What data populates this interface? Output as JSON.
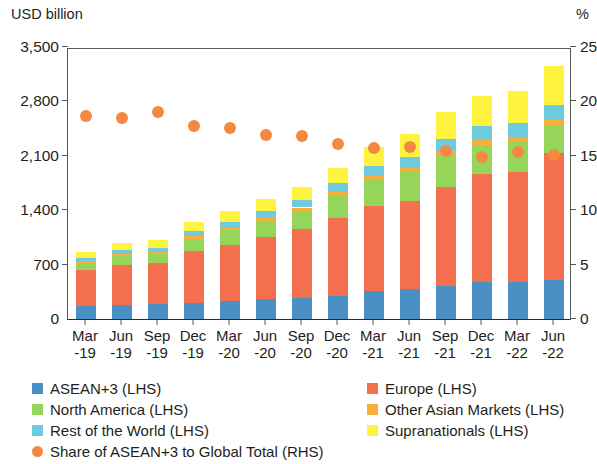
{
  "chart_data": {
    "type": "bar",
    "subtype": "stacked-bar-with-scatter-overlay",
    "title": "",
    "ylabel": "USD billion",
    "y2label": "%",
    "xlabel": "",
    "ylim": [
      0,
      3500
    ],
    "y2lim": [
      0,
      25
    ],
    "yticks": [
      "0",
      "700",
      "1,400",
      "2,100",
      "2,800",
      "3,500"
    ],
    "ytick_values": [
      0,
      700,
      1400,
      2100,
      2800,
      3500
    ],
    "y2ticks": [
      "0",
      "5",
      "10",
      "15",
      "20",
      "25"
    ],
    "y2tick_values": [
      0,
      5,
      10,
      15,
      20,
      25
    ],
    "grid": false,
    "legend_position": "bottom",
    "categories": [
      "Mar-19",
      "Jun-19",
      "Sep-19",
      "Dec-19",
      "Mar-20",
      "Jun-20",
      "Sep-20",
      "Dec-20",
      "Mar-21",
      "Jun-21",
      "Sep-21",
      "Dec-21",
      "Mar-22",
      "Jun-22"
    ],
    "category_lines": [
      [
        "Mar",
        "-19"
      ],
      [
        "Jun",
        "-19"
      ],
      [
        "Sep",
        "-19"
      ],
      [
        "Dec",
        "-19"
      ],
      [
        "Mar",
        "-20"
      ],
      [
        "Jun",
        "-20"
      ],
      [
        "Sep",
        "-20"
      ],
      [
        "Dec",
        "-20"
      ],
      [
        "Mar",
        "-21"
      ],
      [
        "Jun",
        "-21"
      ],
      [
        "Sep",
        "-21"
      ],
      [
        "Dec",
        "-21"
      ],
      [
        "Mar",
        "-22"
      ],
      [
        "Jun",
        "-22"
      ]
    ],
    "series": [
      {
        "name": "ASEAN+3 (LHS)",
        "short": "ASEAN+3",
        "axis": "LHS",
        "color": "#4a90c4",
        "values": [
          170,
          185,
          190,
          205,
          235,
          260,
          275,
          300,
          360,
          385,
          420,
          470,
          475,
          500
        ]
      },
      {
        "name": "Europe (LHS)",
        "short": "Europe",
        "axis": "LHS",
        "color": "#f4704f",
        "values": [
          455,
          510,
          530,
          675,
          720,
          790,
          880,
          1000,
          1090,
          1135,
          1285,
          1400,
          1420,
          1640
        ]
      },
      {
        "name": "North America (LHS)",
        "short": "North America",
        "axis": "LHS",
        "color": "#95d65a",
        "values": [
          100,
          120,
          120,
          155,
          185,
          215,
          240,
          290,
          340,
          370,
          395,
          375,
          380,
          345
        ]
      },
      {
        "name": "Other Asian Markets (LHS)",
        "short": "Other Asian Markets",
        "axis": "LHS",
        "color": "#f8ae3c",
        "values": [
          20,
          22,
          22,
          28,
          32,
          35,
          40,
          46,
          52,
          58,
          60,
          62,
          64,
          70
        ]
      },
      {
        "name": "Rest of the World (LHS)",
        "short": "Rest of the World",
        "axis": "LHS",
        "color": "#6ecadd",
        "values": [
          40,
          52,
          55,
          70,
          78,
          88,
          95,
          110,
          128,
          140,
          160,
          175,
          180,
          200
        ]
      },
      {
        "name": "Supranationals (LHS)",
        "short": "Supranationals",
        "axis": "LHS",
        "color": "#fff33f",
        "values": [
          75,
          90,
          95,
          110,
          135,
          150,
          175,
          200,
          245,
          290,
          345,
          390,
          420,
          495
        ]
      }
    ],
    "overlay_series": {
      "name": "Share of ASEAN+3 to Global Total (RHS)",
      "short": "Share of ASEAN+3 to Global Total",
      "axis": "RHS",
      "type": "scatter",
      "marker": "circle",
      "color": "#f5883f",
      "unit": "%",
      "values": [
        19.2,
        19.0,
        19.6,
        18.3,
        18.1,
        17.5,
        17.4,
        16.6,
        16.3,
        16.4,
        16.0,
        15.4,
        15.9,
        15.6
      ]
    },
    "totals": [
      860,
      979,
      1012,
      1243,
      1385,
      1538,
      1705,
      1946,
      2215,
      2378,
      2665,
      2872,
      2939,
      3250
    ]
  },
  "legend": {
    "left_items": [
      {
        "label": "ASEAN+3 (LHS)",
        "color": "#4a90c4",
        "shape": "square"
      },
      {
        "label": "North America (LHS)",
        "color": "#95d65a",
        "shape": "square"
      },
      {
        "label": "Rest of the World (LHS)",
        "color": "#6ecadd",
        "shape": "square"
      }
    ],
    "right_items": [
      {
        "label": "Europe (LHS)",
        "color": "#f4704f",
        "shape": "square"
      },
      {
        "label": "Other Asian Markets (LHS)",
        "color": "#f8ae3c",
        "shape": "square"
      },
      {
        "label": "Supranationals (LHS)",
        "color": "#fff33f",
        "shape": "square"
      }
    ],
    "share_item": {
      "label": "Share of ASEAN+3 to Global Total (RHS)",
      "color": "#f5883f",
      "shape": "circle"
    }
  }
}
